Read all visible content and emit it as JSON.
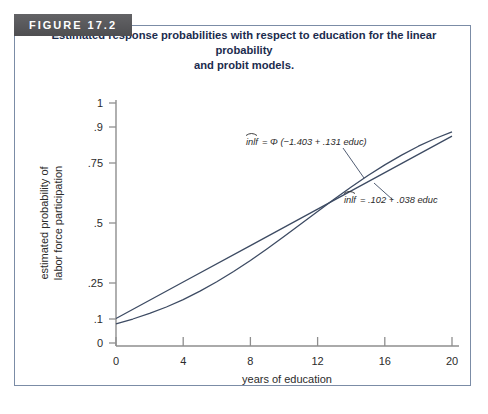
{
  "figure": {
    "badge_label": "FIGURE 17.2",
    "caption_line1": "Estimated response probabilities with respect to education for the linear probability",
    "caption_line2": "and probit models.",
    "border_color": "#7b8ca6",
    "badge_color": "#58585a",
    "caption_color": "#1b2c4e",
    "curve_color": "#3d4b63"
  },
  "chart_data": {
    "type": "line",
    "title": "Estimated response probabilities with respect to education for the linear probability and probit models.",
    "xlabel": "years of education",
    "ylabel": "estimated probability of labor force participation",
    "xlim": [
      0,
      20
    ],
    "ylim": [
      0,
      1
    ],
    "xticks": [
      0,
      4,
      8,
      12,
      16,
      20
    ],
    "xtick_labels": [
      "0",
      "4",
      "8",
      "12",
      "16",
      "20"
    ],
    "yticks": [
      0,
      0.1,
      0.25,
      0.5,
      0.75,
      0.9,
      1
    ],
    "ytick_labels": [
      "0",
      ".1",
      ".25",
      ".5",
      ".75",
      ".9",
      "1"
    ],
    "grid": false,
    "legend_position": "inline-annotation",
    "series": [
      {
        "name": "probit",
        "equation": "inlf = Φ (−1.403 + .131 educ)",
        "label_parts": {
          "lhs": "inlf",
          "rhs": "= Φ (−1.403 + .131 educ)"
        },
        "intercept": -1.403,
        "slope": 0.131,
        "x": [
          0,
          1,
          2,
          3,
          4,
          5,
          6,
          7,
          8,
          9,
          10,
          11,
          12,
          13,
          14,
          15,
          16,
          17,
          18,
          19,
          20
        ],
        "values": [
          0.08,
          0.1,
          0.123,
          0.15,
          0.181,
          0.216,
          0.255,
          0.298,
          0.344,
          0.393,
          0.444,
          0.496,
          0.548,
          0.6,
          0.65,
          0.698,
          0.742,
          0.783,
          0.82,
          0.852,
          0.88
        ]
      },
      {
        "name": "linear probability",
        "equation": "inlf = .102 + .038 educ",
        "label_parts": {
          "lhs": "inlf",
          "rhs": "= .102 + .038 educ"
        },
        "intercept": 0.102,
        "slope": 0.038,
        "x": [
          0,
          4,
          8,
          12,
          16,
          20
        ],
        "values": [
          0.102,
          0.254,
          0.406,
          0.558,
          0.71,
          0.862
        ]
      }
    ],
    "annotations": [
      {
        "text": "inlf = Φ (−1.403 + .131 educ)",
        "anchor_x": 12.6,
        "anchor_y": 0.565
      },
      {
        "text": "inlf = .102 + .038 educ",
        "anchor_x": 14.2,
        "anchor_y": 0.62
      }
    ]
  }
}
